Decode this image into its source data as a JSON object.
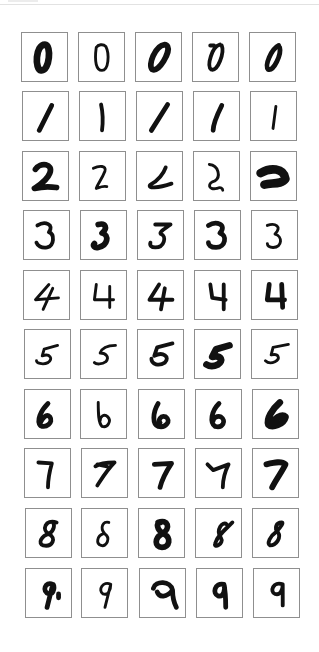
{
  "figure": {
    "rows": 10,
    "cols": 5,
    "border_color": "#8f8f8f",
    "ink_color": "#111111"
  },
  "grid": [
    {
      "label": "0",
      "samples": [
        "0",
        "0",
        "0",
        "0",
        "0"
      ]
    },
    {
      "label": "1",
      "samples": [
        "1",
        "1",
        "1",
        "1",
        "1"
      ]
    },
    {
      "label": "2",
      "samples": [
        "2",
        "2",
        "2",
        "2",
        "2"
      ]
    },
    {
      "label": "3",
      "samples": [
        "3",
        "3",
        "3",
        "3",
        "3"
      ]
    },
    {
      "label": "4",
      "samples": [
        "4",
        "4",
        "4",
        "4",
        "4"
      ]
    },
    {
      "label": "5",
      "samples": [
        "5",
        "5",
        "5",
        "5",
        "5"
      ]
    },
    {
      "label": "6",
      "samples": [
        "6",
        "6",
        "6",
        "6",
        "6"
      ]
    },
    {
      "label": "7",
      "samples": [
        "7",
        "7",
        "7",
        "7",
        "7"
      ]
    },
    {
      "label": "8",
      "samples": [
        "8",
        "8",
        "8",
        "8",
        "8"
      ]
    },
    {
      "label": "9",
      "samples": [
        "9",
        "9",
        "9",
        "9",
        "9"
      ]
    }
  ]
}
